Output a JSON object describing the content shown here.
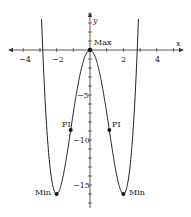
{
  "chart_data": {
    "type": "line",
    "title": "",
    "function": "y = x^4 - 8x^2",
    "xlabel": "x",
    "ylabel": "y",
    "xlim": [
      -5,
      5.5
    ],
    "ylim": [
      -18,
      4
    ],
    "x_ticks": [
      -4,
      -3,
      -2,
      -1,
      1,
      2,
      3,
      4,
      5
    ],
    "x_tick_labels": [
      "-4",
      "-2",
      "2",
      "4"
    ],
    "x_tick_label_values": [
      -4,
      -2,
      2,
      4
    ],
    "y_ticks": [
      -1,
      -2,
      -3,
      -4,
      -5,
      -6,
      -7,
      -8,
      -9,
      -10,
      -11,
      -12,
      -13,
      -14,
      -15,
      -16,
      -17,
      1,
      2,
      3,
      4
    ],
    "y_tick_labels": [
      "-5",
      "-10",
      "-15"
    ],
    "y_tick_label_values": [
      -5,
      -10,
      -15
    ],
    "grid": false,
    "series": [
      {
        "name": "f(x)",
        "x": [
          -2.95,
          -2.83,
          -2.5,
          -2.0,
          -1.5,
          -1.155,
          -1.0,
          -0.5,
          0,
          0.5,
          1.0,
          1.155,
          1.5,
          2.0,
          2.5,
          2.83,
          2.95
        ],
        "y": [
          3.89,
          0,
          -11.06,
          -16,
          -12.94,
          -8.89,
          -7,
          -1.94,
          0,
          -1.94,
          -7,
          -8.89,
          -12.94,
          -16,
          -11.06,
          0,
          3.89
        ]
      }
    ],
    "annotations": [
      {
        "label": "Max",
        "x": 0,
        "y": 0
      },
      {
        "label": "PI",
        "x": -1.155,
        "y": -8.89
      },
      {
        "label": "PI",
        "x": 1.155,
        "y": -8.89
      },
      {
        "label": "Min",
        "x": -2,
        "y": -16
      },
      {
        "label": "Min",
        "x": 2,
        "y": -16
      }
    ]
  },
  "labels": {
    "x_axis": "x",
    "y_axis": "y",
    "x_ticks": [
      "-4",
      "-2",
      "2",
      "4"
    ],
    "y_ticks": [
      "-5",
      "-10",
      "-15"
    ],
    "max": "Max",
    "pi_left": "PI",
    "pi_right": "PI",
    "min_left": "Min",
    "min_right": "Min"
  }
}
